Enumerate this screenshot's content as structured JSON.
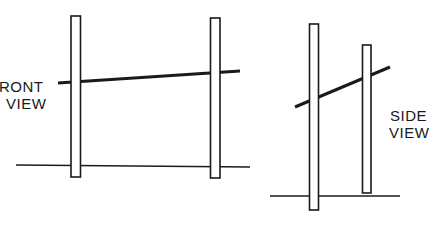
{
  "diagram": {
    "front_view": {
      "label_line1": "RONT",
      "label_line2": "VIEW"
    },
    "side_view": {
      "label_line1": "SIDE",
      "label_line2": "VIEW"
    },
    "colors": {
      "ink": "#1a1a1a",
      "background": "#ffffff"
    }
  }
}
